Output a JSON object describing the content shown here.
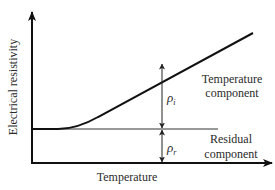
{
  "diagram": {
    "y_axis_label": "Electrical resistivity",
    "x_axis_label": "Temperature",
    "temperature_component": {
      "symbol": "ρ",
      "subscript": "i",
      "label_line1": "Temperature",
      "label_line2": "component"
    },
    "residual_component": {
      "symbol": "ρ",
      "subscript": "r",
      "label_line1": "Residual",
      "label_line2": "component"
    },
    "colors": {
      "curve": "#111111",
      "axes": "#111111",
      "residual_line": "#333333",
      "text": "#2a2a2a"
    }
  }
}
